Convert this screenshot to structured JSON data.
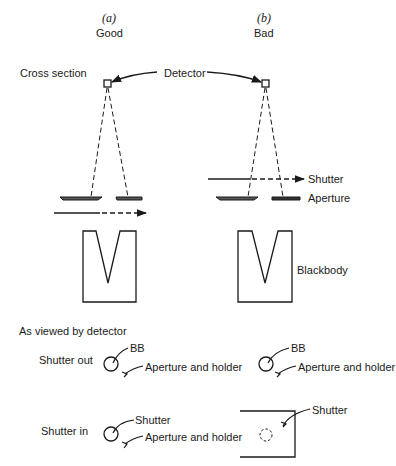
{
  "columns": [
    {
      "letter": "(a)",
      "label": "Good"
    },
    {
      "letter": "(b)",
      "label": "Bad"
    }
  ],
  "cross_section": {
    "title": "Cross section",
    "detector_label": "Detector",
    "shutter_label": "Shutter",
    "aperture_label": "Aperture",
    "blackbody_label": "Blackbody"
  },
  "viewed": {
    "title": "As viewed by detector",
    "rows": [
      {
        "label": "Shutter out",
        "good": {
          "top": "BB",
          "bottom": "Aperture and holder"
        },
        "bad": {
          "top": "BB",
          "bottom": "Aperture and holder"
        }
      },
      {
        "label": "Shutter in",
        "good": {
          "top": "Shutter",
          "bottom": "Aperture and holder"
        },
        "bad": {
          "top": "Shutter"
        }
      }
    ]
  }
}
